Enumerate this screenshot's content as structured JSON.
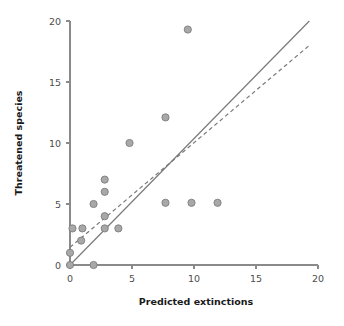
{
  "chart_data": {
    "type": "scatter",
    "title": "",
    "xlabel": "Predicted extinctions",
    "ylabel": "Threatened species",
    "xlim": [
      0,
      20
    ],
    "ylim": [
      0,
      20
    ],
    "xticks": [
      0,
      5,
      10,
      15,
      20
    ],
    "yticks": [
      0,
      5,
      10,
      15,
      20
    ],
    "xtick_labels": [
      "0",
      "5",
      "10",
      "15",
      "20"
    ],
    "ytick_labels": [
      "0",
      "5",
      "10",
      "15",
      "20"
    ],
    "grid": false,
    "legend": "none",
    "marker": {
      "shape": "circle",
      "fill_color": "#a8a8a8",
      "edge_color": "#7d7d7d",
      "radius_px": 3.6
    },
    "points": [
      {
        "x": 0.0,
        "y": 0.0
      },
      {
        "x": 0.0,
        "y": 1.0
      },
      {
        "x": 0.2,
        "y": 3.0
      },
      {
        "x": 0.9,
        "y": 2.0
      },
      {
        "x": 1.0,
        "y": 3.0
      },
      {
        "x": 1.9,
        "y": 0.0
      },
      {
        "x": 1.9,
        "y": 5.0
      },
      {
        "x": 2.8,
        "y": 3.0
      },
      {
        "x": 2.8,
        "y": 4.0
      },
      {
        "x": 2.8,
        "y": 6.0
      },
      {
        "x": 2.8,
        "y": 7.0
      },
      {
        "x": 3.9,
        "y": 3.0
      },
      {
        "x": 4.8,
        "y": 10.0
      },
      {
        "x": 7.7,
        "y": 5.1
      },
      {
        "x": 7.7,
        "y": 12.1
      },
      {
        "x": 9.5,
        "y": 19.3
      },
      {
        "x": 9.8,
        "y": 5.1
      },
      {
        "x": 11.9,
        "y": 5.1
      }
    ],
    "lines": [
      {
        "name": "identity-line",
        "style": "solid",
        "color": "#7a7a7a",
        "x0": 0.0,
        "y0": 0.0,
        "x1": 19.3,
        "y1": 20.0
      },
      {
        "name": "regression-line",
        "style": "dashed",
        "color": "#7a7a7a",
        "x0": 0.0,
        "y0": 1.45,
        "x1": 19.3,
        "y1": 18.0
      }
    ],
    "axis_color": "#8a8a8a",
    "label_color": "#1a1a1a"
  }
}
